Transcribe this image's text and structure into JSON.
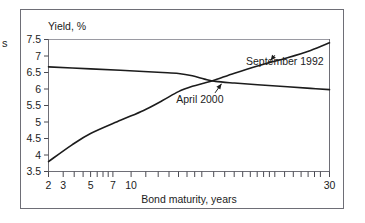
{
  "chart_data": {
    "type": "line",
    "title": "",
    "ylabel": "Yield, %",
    "xlabel": "Bond maturity, years",
    "xscale": "log",
    "xlim": [
      2,
      30
    ],
    "ylim": [
      3.5,
      7.5
    ],
    "yticks": [
      "7.5",
      "7",
      "6.5",
      "6",
      "5.5",
      "5",
      "4.5",
      "4",
      "3.5"
    ],
    "ytick_values": [
      7.5,
      7,
      6.5,
      6,
      5.5,
      5,
      4.5,
      4,
      3.5
    ],
    "xticks": [
      "2",
      "3",
      "5",
      "7",
      "10",
      "30"
    ],
    "xtick_values": [
      2,
      3,
      5,
      7,
      10,
      30
    ],
    "grid": false,
    "legend": "annotations",
    "line_color": "#1c1c1c",
    "series": [
      {
        "name": "September 1992",
        "x": [
          2,
          2.5,
          3,
          4,
          5,
          6,
          7,
          8,
          9,
          10,
          12,
          15,
          20,
          25,
          30
        ],
        "values": [
          3.8,
          4.3,
          4.65,
          5.05,
          5.35,
          5.65,
          5.92,
          6.08,
          6.18,
          6.28,
          6.48,
          6.7,
          6.95,
          7.17,
          7.4
        ]
      },
      {
        "name": "April 2000",
        "x": [
          2,
          3,
          4,
          5,
          6,
          7,
          8,
          9,
          10,
          12,
          15,
          20,
          25,
          30
        ],
        "values": [
          6.67,
          6.61,
          6.57,
          6.53,
          6.5,
          6.47,
          6.4,
          6.3,
          6.23,
          6.18,
          6.13,
          6.07,
          6.02,
          5.98
        ]
      }
    ],
    "annotations": [
      {
        "label": "September 1992",
        "text_x": 19.5,
        "text_y": 6.72,
        "arrow_to_x": 17.0,
        "arrow_to_y": 6.86
      },
      {
        "label": "April 2000",
        "text_x": 8.6,
        "text_y": 5.58,
        "arrow_to_x": 10.6,
        "arrow_to_y": 6.16
      }
    ]
  },
  "margin": {
    "cut_fragment": "s"
  }
}
